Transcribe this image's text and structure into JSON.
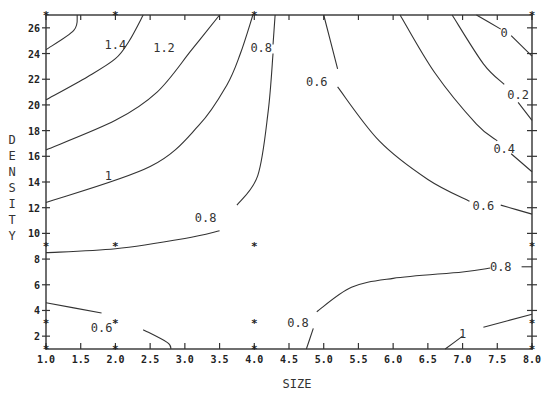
{
  "chart_data": {
    "type": "contour",
    "title": "",
    "xlabel": "SIZE",
    "ylabel": "DENSITY",
    "xlim": [
      1.0,
      8.0
    ],
    "ylim": [
      1,
      27
    ],
    "x_ticks": [
      "1.0",
      "1.5",
      "2.0",
      "2.5",
      "3.0",
      "3.5",
      "4.0",
      "4.5",
      "5.0",
      "5.5",
      "6.0",
      "6.5",
      "7.0",
      "7.5",
      "8.0"
    ],
    "y_ticks": [
      "2",
      "4",
      "6",
      "8",
      "10",
      "12",
      "14",
      "16",
      "18",
      "20",
      "22",
      "24",
      "26"
    ],
    "grid": false,
    "design_points": [
      [
        1,
        1
      ],
      [
        1,
        3
      ],
      [
        1,
        9
      ],
      [
        1,
        27
      ],
      [
        2,
        1
      ],
      [
        2,
        3
      ],
      [
        2,
        9
      ],
      [
        2,
        27
      ],
      [
        4,
        1
      ],
      [
        4,
        3
      ],
      [
        4,
        9
      ],
      [
        4,
        27
      ],
      [
        8,
        1
      ],
      [
        8,
        3
      ],
      [
        8,
        9
      ],
      [
        8,
        27
      ]
    ],
    "contours": [
      {
        "level": "1.6",
        "label": "",
        "points": [
          [
            1.0,
            24.3
          ],
          [
            1.4,
            25.8
          ],
          [
            1.45,
            27
          ]
        ]
      },
      {
        "level": "1.4",
        "label": "1.4",
        "label_pos": [
          2.0,
          24.7
        ],
        "points": [
          [
            1.0,
            20.4
          ],
          [
            1.6,
            22.2
          ],
          [
            2.0,
            23.6
          ],
          [
            2.2,
            25
          ],
          [
            2.4,
            27
          ]
        ]
      },
      {
        "level": "1.2",
        "label": "1.2",
        "label_pos": [
          2.7,
          24.4
        ],
        "points": [
          [
            1.0,
            16.5
          ],
          [
            2.0,
            18.8
          ],
          [
            2.6,
            21
          ],
          [
            3.1,
            24.3
          ],
          [
            3.5,
            27
          ]
        ]
      },
      {
        "level": "1.0",
        "label": "1",
        "label_pos": [
          1.9,
          14.5
        ],
        "points": [
          [
            1.0,
            12.4
          ],
          [
            2.5,
            15.2
          ],
          [
            3.2,
            18.4
          ],
          [
            3.6,
            21.5
          ],
          [
            3.8,
            24
          ],
          [
            3.98,
            27
          ]
        ]
      },
      {
        "level": "0.8",
        "label": "0.8",
        "label_pos": [
          4.1,
          24.4
        ],
        "points": [
          [
            4.3,
            27
          ],
          [
            4.27,
            24.7
          ]
        ]
      },
      {
        "level": "0.8",
        "label": "0.8",
        "label_pos": [
          3.3,
          11.2
        ],
        "points": [
          [
            4.27,
            24
          ],
          [
            4.2,
            19.5
          ],
          [
            4.05,
            14.5
          ],
          [
            3.75,
            12.2
          ]
        ]
      },
      {
        "level": "0.8",
        "label": "",
        "points": [
          [
            3.5,
            10.2
          ],
          [
            3.0,
            9.6
          ],
          [
            2.0,
            8.8
          ],
          [
            1.0,
            8.5
          ]
        ]
      },
      {
        "level": "0.6",
        "label": "0.6",
        "label_pos": [
          4.9,
          21.8
        ],
        "points": [
          [
            5.0,
            27
          ],
          [
            5.2,
            22.8
          ]
        ]
      },
      {
        "level": "0.6",
        "label": "0.6",
        "label_pos": [
          7.3,
          12.1
        ],
        "points": [
          [
            5.2,
            21.4
          ],
          [
            5.8,
            17.2
          ],
          [
            6.5,
            14.2
          ],
          [
            7.1,
            12.5
          ]
        ]
      },
      {
        "level": "0.6",
        "label": "",
        "points": [
          [
            7.55,
            12.2
          ],
          [
            8.0,
            11.5
          ]
        ]
      },
      {
        "level": "0.4",
        "label": "0.4",
        "label_pos": [
          7.6,
          16.6
        ],
        "points": [
          [
            6.1,
            27
          ],
          [
            6.6,
            22.5
          ],
          [
            7.2,
            18.5
          ],
          [
            7.5,
            17.2
          ]
        ]
      },
      {
        "level": "0.4",
        "label": "",
        "points": [
          [
            7.7,
            16.2
          ],
          [
            8.0,
            14.8
          ]
        ]
      },
      {
        "level": "0.2",
        "label": "0.2",
        "label_pos": [
          7.8,
          20.8
        ],
        "points": [
          [
            6.85,
            27
          ],
          [
            7.3,
            23.2
          ],
          [
            7.6,
            21.6
          ]
        ]
      },
      {
        "level": "0.2",
        "label": "",
        "points": [
          [
            7.8,
            20.2
          ],
          [
            8.0,
            18.8
          ]
        ]
      },
      {
        "level": "0.0",
        "label": "0",
        "label_pos": [
          7.6,
          25.6
        ],
        "points": [
          [
            7.2,
            27
          ],
          [
            7.55,
            25.9
          ]
        ]
      },
      {
        "level": "0.0",
        "label": "",
        "points": [
          [
            7.7,
            25.4
          ],
          [
            8.0,
            23.8
          ]
        ]
      },
      {
        "level": "0.8",
        "label": "0.8",
        "label_pos": [
          7.55,
          7.4
        ],
        "points": [
          [
            4.9,
            3.9
          ],
          [
            5.4,
            5.8
          ],
          [
            6.0,
            6.5
          ],
          [
            7.0,
            7.0
          ],
          [
            7.4,
            7.3
          ]
        ]
      },
      {
        "level": "0.8",
        "label": "",
        "points": [
          [
            7.85,
            7.4
          ],
          [
            8.0,
            7.4
          ]
        ]
      },
      {
        "level": "0.8",
        "label": "0.8",
        "label_pos": [
          4.63,
          3.0
        ],
        "points": [
          [
            4.75,
            1
          ],
          [
            4.85,
            2.6
          ]
        ]
      },
      {
        "level": "0.6",
        "label": "0.6",
        "label_pos": [
          1.8,
          2.6
        ],
        "points": [
          [
            1.0,
            4.6
          ],
          [
            1.8,
            3.8
          ]
        ]
      },
      {
        "level": "0.6",
        "label": "",
        "points": [
          [
            2.4,
            2.5
          ],
          [
            2.75,
            1.5
          ],
          [
            2.8,
            1
          ]
        ]
      },
      {
        "level": "1.0",
        "label": "1",
        "label_pos": [
          7.0,
          2.2
        ],
        "points": [
          [
            6.75,
            1
          ],
          [
            7.0,
            2
          ]
        ]
      },
      {
        "level": "1.0",
        "label": "",
        "points": [
          [
            7.3,
            2.7
          ],
          [
            8.0,
            3.7
          ]
        ]
      }
    ]
  },
  "axes": {
    "x_title": "SIZE",
    "y_title_letters": [
      "D",
      "E",
      "N",
      "S",
      "I",
      "T",
      "Y"
    ]
  }
}
